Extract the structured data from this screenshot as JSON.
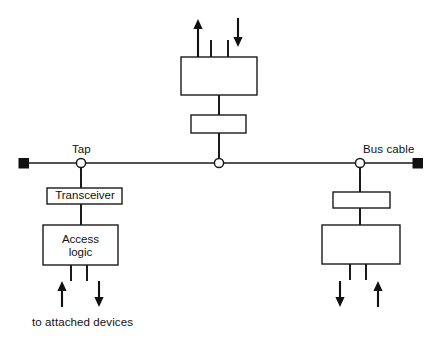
{
  "diagram": {
    "labels": {
      "tap": "Tap",
      "bus_cable": "Bus cable",
      "transceiver": "Transceiver",
      "access_logic_line1": "Access",
      "access_logic_line2": "logic",
      "attached_devices": "to attached devices"
    },
    "colors": {
      "line": "#1a1a1a",
      "fill": "#ffffff",
      "terminator": "#111111",
      "text": "#111111"
    },
    "bus": {
      "y": 163,
      "x_start": 23,
      "x_end": 418,
      "terminators": [
        {
          "name": "left-terminator",
          "x": 23
        },
        {
          "name": "right-terminator",
          "x": 418
        }
      ],
      "taps": [
        {
          "name": "tap-left",
          "x": 81,
          "labeled": "Tap"
        },
        {
          "name": "tap-center",
          "x": 219,
          "labeled": ""
        },
        {
          "name": "tap-right",
          "x": 360,
          "labeled": "Bus cable"
        }
      ]
    },
    "stations": [
      {
        "name": "station-left",
        "position": "below",
        "tap_x": 81,
        "transceiver_box": {
          "x": 47,
          "y": 188,
          "w": 75,
          "h": 16,
          "label": "Transceiver"
        },
        "logic_box": {
          "x": 43,
          "y": 225,
          "w": 75,
          "h": 40,
          "label": "Access logic"
        },
        "device_stubs": [
          71,
          87
        ],
        "arrows": [
          {
            "name": "arrow-up-left-station",
            "x": 62,
            "direction": "up"
          },
          {
            "name": "arrow-down-left-station",
            "x": 99,
            "direction": "down"
          }
        ],
        "caption": "to attached devices"
      },
      {
        "name": "station-top",
        "position": "above",
        "tap_x": 219,
        "transceiver_box": {
          "x": 191,
          "y": 115,
          "w": 55,
          "h": 18,
          "label": ""
        },
        "logic_box": {
          "x": 181,
          "y": 57,
          "w": 76,
          "h": 38,
          "label": ""
        },
        "device_stubs": [
          211,
          228
        ],
        "arrows": [
          {
            "name": "arrow-up-top-station",
            "x": 198,
            "direction": "up"
          },
          {
            "name": "arrow-down-top-station",
            "x": 238,
            "direction": "down"
          }
        ],
        "caption": ""
      },
      {
        "name": "station-right",
        "position": "below",
        "tap_x": 360,
        "transceiver_box": {
          "x": 333,
          "y": 192,
          "w": 57,
          "h": 16,
          "label": ""
        },
        "logic_box": {
          "x": 322,
          "y": 225,
          "w": 78,
          "h": 39,
          "label": ""
        },
        "device_stubs": [
          350,
          366
        ],
        "arrows": [
          {
            "name": "arrow-down-right-station",
            "x": 340,
            "direction": "down"
          },
          {
            "name": "arrow-up-right-station",
            "x": 378,
            "direction": "up"
          }
        ],
        "caption": ""
      }
    ]
  }
}
